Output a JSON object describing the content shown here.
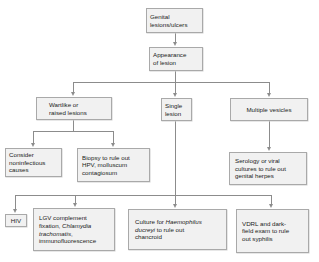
{
  "diagram": {
    "type": "flowchart",
    "title": "Genital lesions/ulcers",
    "nodes": {
      "root": {
        "text": "Genital lesions/ulcers",
        "lines": [
          "Genital",
          "lesions/ulcers"
        ]
      },
      "appearance": {
        "text": "Appearance of lesion",
        "lines": [
          "Appearance",
          "of lesion"
        ]
      },
      "wartlike": {
        "text": "Wartlike or raised lesions",
        "lines": [
          "Wartlike or",
          "raised lesions"
        ]
      },
      "single": {
        "text": "Single lesion",
        "lines": [
          "Single",
          "lesion"
        ]
      },
      "multiple": {
        "text": "Multiple vesicles",
        "lines": [
          "Multiple vesicles"
        ]
      },
      "noninfectious": {
        "text": "Consider noninfectious causes",
        "lines": [
          "Consider",
          "noninfectious",
          "causes"
        ]
      },
      "biopsy": {
        "text": "Biopsy to rule out HPV, molluscum contagiosum",
        "lines": [
          "Biopsy to rule out",
          "HPV, molluscum",
          "contagiosum"
        ]
      },
      "serology": {
        "text": "Serology or viral cultures to rule out genital herpes",
        "lines": [
          "Serology or viral",
          "cultures to rule out",
          "genital herpes"
        ]
      },
      "hiv": {
        "text": "HIV",
        "lines": [
          "HIV"
        ]
      },
      "lgv": {
        "text": "LGV complement fixation, Chlamydia trachomatis, immunofluorescence",
        "line1": "LGV complement",
        "line2_plain": "fixation, ",
        "line2_italic": "Chlamydia",
        "line3_italic": "trachomatis",
        "line3_plain": ",",
        "line4": "immunofluorescence"
      },
      "culture": {
        "text": "Culture for Haemophilus ducreyi to rule out chancroid",
        "line1_plain": "Culture for ",
        "line1_italic": "Haemophilus",
        "line2_italic": "ducreyi",
        "line2_plain": " to rule out",
        "line3": "chancroid"
      },
      "vdrl": {
        "text": "VDRL and dark-field exam to rule out syphilis",
        "lines": [
          "VDRL and dark-",
          "field exam to rule",
          "out syphilis"
        ]
      }
    },
    "edges": [
      [
        "root",
        "appearance"
      ],
      [
        "appearance",
        "wartlike"
      ],
      [
        "appearance",
        "single"
      ],
      [
        "appearance",
        "multiple"
      ],
      [
        "wartlike",
        "noninfectious"
      ],
      [
        "wartlike",
        "biopsy"
      ],
      [
        "multiple",
        "serology"
      ],
      [
        "single",
        "hiv"
      ],
      [
        "single",
        "lgv"
      ],
      [
        "single",
        "culture"
      ],
      [
        "single",
        "vdrl"
      ]
    ],
    "colors": {
      "box_fill": "#f1f1f1",
      "box_border": "#a9a9a9",
      "connector": "#8c8c8c",
      "text": "#222222"
    }
  }
}
